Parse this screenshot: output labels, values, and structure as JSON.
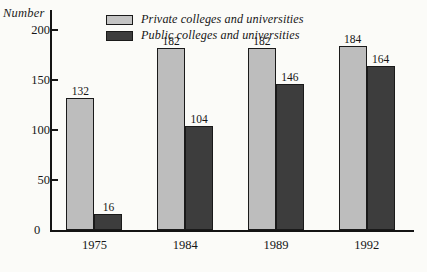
{
  "chart_data": {
    "type": "bar",
    "title": "",
    "xlabel": "",
    "ylabel": "Number",
    "ylim": [
      0,
      220
    ],
    "yticks": [
      50,
      100,
      150,
      200
    ],
    "ytick_labels": [
      "50",
      "100",
      "150",
      "200"
    ],
    "zero_label": "0",
    "grid": false,
    "legend_position": "top-center",
    "categories": [
      "1975",
      "1984",
      "1989",
      "1992"
    ],
    "series": [
      {
        "name": "Private colleges and universities",
        "color": "#bdbdbd",
        "values": [
          132,
          182,
          182,
          184
        ],
        "value_labels": [
          "132",
          "182",
          "182",
          "184"
        ]
      },
      {
        "name": "Public colleges and universities",
        "color": "#3d3d3d",
        "values": [
          16,
          104,
          146,
          164
        ],
        "value_labels": [
          "16",
          "104",
          "146",
          "164"
        ]
      }
    ]
  },
  "axis": {
    "y_title": "Number"
  },
  "legend": {
    "items": [
      {
        "label": "Private colleges and universities",
        "swatch": "#c4c4c4"
      },
      {
        "label": "Public colleges and universities",
        "swatch": "#3d3d3d"
      }
    ]
  }
}
